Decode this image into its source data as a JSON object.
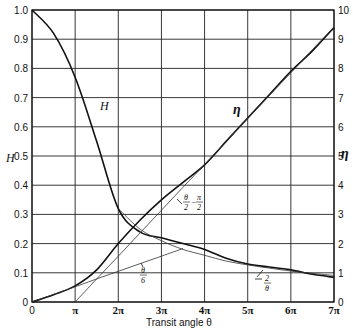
{
  "chart_data": {
    "type": "line",
    "title": "",
    "xlabel": "Transit angle θ",
    "ylabel_left": "H",
    "ylabel_right": "η",
    "x_ticks": [
      "0",
      "π",
      "2π",
      "3π",
      "4π",
      "5π",
      "6π",
      "7π"
    ],
    "x_range": [
      0,
      7
    ],
    "x_unit": "π",
    "left_ticks": [
      "0",
      "0.1",
      "0.2",
      "0.3",
      "0.4",
      "0.5",
      "0.6",
      "0.7",
      "0.8",
      "0.9",
      "1.0"
    ],
    "left_range": [
      0,
      1.0
    ],
    "right_ticks": [
      "0",
      "1",
      "2",
      "3",
      "4",
      "5",
      "6",
      "7",
      "8",
      "9",
      "10"
    ],
    "right_range": [
      0,
      10
    ],
    "grid": true,
    "x": [
      0,
      0.5,
      1,
      1.5,
      2,
      2.5,
      3,
      3.5,
      4,
      4.5,
      5,
      5.5,
      6,
      6.5,
      7
    ],
    "series": [
      {
        "name": "H",
        "axis": "left",
        "values": [
          1.0,
          0.92,
          0.77,
          0.55,
          0.32,
          0.24,
          0.22,
          0.2,
          0.18,
          0.15,
          0.13,
          0.12,
          0.11,
          0.095,
          0.085
        ]
      },
      {
        "name": "η",
        "axis": "right",
        "values": [
          0,
          0.25,
          0.55,
          1.1,
          2.0,
          2.8,
          3.5,
          4.1,
          4.7,
          5.5,
          6.3,
          7.1,
          7.9,
          8.6,
          9.4
        ]
      },
      {
        "name": "θ/2 − π/2 (asymptote)",
        "axis": "right",
        "values": [
          null,
          null,
          0,
          0.79,
          1.57,
          2.36,
          3.14,
          3.93,
          4.71,
          5.5,
          6.28,
          7.07,
          7.85,
          8.64,
          9.42
        ]
      },
      {
        "name": "θ/6 (asymptote)",
        "axis": "right",
        "values": [
          0,
          0.26,
          0.52,
          0.79,
          1.05,
          1.31,
          1.57,
          1.83,
          null,
          null,
          null,
          null,
          null,
          null,
          null
        ]
      },
      {
        "name": "2/θ (asymptote)",
        "axis": "left",
        "values": [
          null,
          null,
          null,
          null,
          0.32,
          0.25,
          0.21,
          0.18,
          0.16,
          0.14,
          0.127,
          0.116,
          0.106,
          0.098,
          0.091
        ]
      }
    ],
    "annotations": [
      {
        "text": "H",
        "near": "H curve upper left"
      },
      {
        "text": "η",
        "near": "η curve upper right"
      },
      {
        "text": "θ/2 − π/2",
        "near": "η asymptote at ~3π"
      },
      {
        "text": "θ/6",
        "near": "low-θ asymptote at ~2.5π"
      },
      {
        "text": "2/θ",
        "near": "H asymptote at ~5.5π"
      }
    ]
  }
}
